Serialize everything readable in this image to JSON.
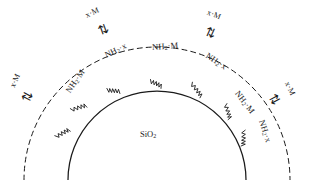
{
  "figure": {
    "type": "schematic-diagram",
    "core_label": "SiO",
    "core_subscript": "2",
    "colors": {
      "ink": "#1a1a1a",
      "background": "#ffffff"
    },
    "core_boundary": {
      "style": "solid",
      "name": "silica-core-surface"
    },
    "outer_boundary": {
      "style": "dashed",
      "name": "functional-shell-boundary"
    },
    "linker": {
      "style": "zigzag",
      "name": "tether-chain"
    }
  },
  "surface_sites": [
    {
      "id": "site-1",
      "head": "NH",
      "sub": "2",
      "dot": "·",
      "tail": "M",
      "rotation": -55
    },
    {
      "id": "site-2",
      "head": "NH",
      "sub": "2",
      "dot": "·",
      "tail": "x",
      "rotation": -26
    },
    {
      "id": "site-3",
      "head": "NH",
      "sub": "2",
      "dot": "·",
      "tail": "M",
      "rotation": -4
    },
    {
      "id": "site-4",
      "head": "NH",
      "sub": "2",
      "dot": "·",
      "tail": "x",
      "rotation": 34
    },
    {
      "id": "site-5",
      "head": "NH",
      "sub": "2",
      "dot": "·",
      "tail": "M",
      "rotation": 52
    },
    {
      "id": "site-6",
      "head": "NH",
      "sub": "2",
      "dot": "·",
      "tail": "x",
      "rotation": 72
    }
  ],
  "reagents": [
    {
      "id": "reagent-left",
      "head": "x",
      "dot": "·",
      "tail": "M",
      "rotation": -66,
      "arrow": "⇅",
      "arrow_rotation": -62
    },
    {
      "id": "reagent-top-left",
      "head": "x",
      "dot": "·",
      "tail": "M",
      "rotation": -24,
      "arrow": "⇅",
      "arrow_rotation": -20
    },
    {
      "id": "reagent-top-right",
      "head": "x",
      "dot": "·",
      "tail": "M",
      "rotation": 22,
      "arrow": "⇅",
      "arrow_rotation": 24
    },
    {
      "id": "reagent-right",
      "head": "x",
      "dot": "·",
      "tail": "M",
      "rotation": 64,
      "arrow": "⇅",
      "arrow_rotation": 62
    }
  ]
}
